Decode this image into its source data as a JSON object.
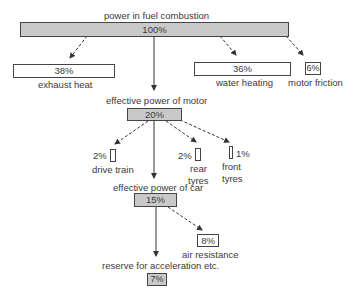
{
  "diagram": {
    "top": {
      "title": "power in fuel combustion",
      "value": "100%"
    },
    "losses_level1": [
      {
        "id": "exhaust",
        "value": "38%",
        "label": "exhaust heat"
      },
      {
        "id": "water",
        "value": "36%",
        "label": "water heating"
      },
      {
        "id": "friction",
        "value": "6%",
        "label": "motor friction"
      }
    ],
    "motor": {
      "title": "effective power of motor",
      "value": "20%"
    },
    "losses_level2": [
      {
        "id": "drive-train",
        "value": "2%",
        "label": "drive train"
      },
      {
        "id": "rear-tyres",
        "value": "2%",
        "label_line1": "rear",
        "label_line2": "tyres"
      },
      {
        "id": "front-tyres",
        "value": "1%",
        "label_line1": "front",
        "label_line2": "tyres"
      }
    ],
    "car": {
      "title": "effective power of car",
      "value": "15%"
    },
    "air": {
      "value": "8%",
      "label": "air resistance"
    },
    "reserve": {
      "title": "reserve for acceleration etc.",
      "value": "7%"
    },
    "colors": {
      "box_fill": "#c9c9c9",
      "line": "#333333"
    }
  }
}
